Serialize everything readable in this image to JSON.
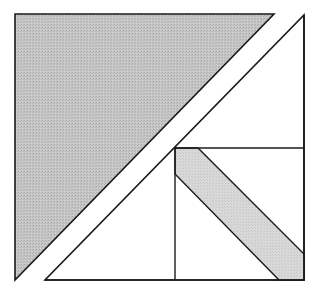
{
  "diagram": {
    "width": 324,
    "height": 293,
    "colors": {
      "background": "#ffffff",
      "dark_fill": "#c3c3c3",
      "light_fill": "#d7d7d7",
      "white_fill": "#ffffff",
      "stroke": "#1a1a1a"
    },
    "shapes": [
      {
        "name": "large-gray-triangle",
        "fill": "dark_fill",
        "points": "15,14 274,14 15,280"
      },
      {
        "name": "upper-right-white-triangle",
        "fill": "white_fill",
        "points": "304,15 304,148 175,148 174,148 175,148 175,147 174,147"
      },
      {
        "name": "diagonal-gray-strip",
        "fill": "light_fill",
        "points": "175,148 198,148 304,254 304,280 279,280 175,174"
      },
      {
        "name": "lower-left-white-triangle",
        "fill": "white_fill",
        "points": "175,148 175,280 45,280"
      }
    ]
  }
}
